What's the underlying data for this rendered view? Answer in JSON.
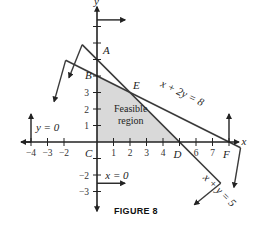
{
  "figure": {
    "caption": "FIGURE 8",
    "region_label_line1": "Feasible",
    "region_label_line2": "region",
    "colors": {
      "line": "#3a3a3a",
      "region_fill": "#d9d9d9",
      "axis": "#222222"
    }
  },
  "axes": {
    "x_label": "x",
    "y_label": "y",
    "x_ticks": [
      {
        "value": -4,
        "label": "-4"
      },
      {
        "value": -3,
        "label": "-3"
      },
      {
        "value": -2,
        "label": "-2"
      },
      {
        "value": 1,
        "label": "1"
      },
      {
        "value": 2,
        "label": "2"
      },
      {
        "value": 3,
        "label": "3"
      },
      {
        "value": 4,
        "label": "4"
      },
      {
        "value": 6,
        "label": "6"
      },
      {
        "value": 7,
        "label": "7"
      }
    ],
    "y_ticks": [
      {
        "value": 1,
        "label": "1"
      },
      {
        "value": 2,
        "label": "2"
      },
      {
        "value": 3,
        "label": "3"
      },
      {
        "value": -2,
        "label": "-2"
      },
      {
        "value": -3,
        "label": "-3"
      }
    ],
    "x_range": [
      -4.5,
      8.5
    ],
    "y_range": [
      -3.5,
      8
    ]
  },
  "points": [
    {
      "name": "A",
      "x": 0,
      "y": 5
    },
    {
      "name": "B",
      "x": 0,
      "y": 4
    },
    {
      "name": "C",
      "x": 0,
      "y": 0
    },
    {
      "name": "D",
      "x": 5,
      "y": 0
    },
    {
      "name": "E",
      "x": 2,
      "y": 3
    },
    {
      "name": "F",
      "x": 8,
      "y": 0
    }
  ],
  "constraints": [
    {
      "label": "x + 2y = 8",
      "a": 1,
      "b": 2,
      "c": 8
    },
    {
      "label": "x + y = 5",
      "a": 1,
      "b": 1,
      "c": 5
    },
    {
      "label": "y = 0"
    },
    {
      "label": "x = 0"
    }
  ],
  "feasible_region": [
    [
      0,
      0
    ],
    [
      0,
      4
    ],
    [
      2,
      3
    ],
    [
      5,
      0
    ]
  ]
}
